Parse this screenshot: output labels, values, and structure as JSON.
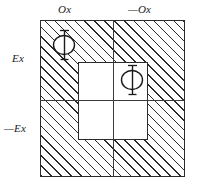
{
  "figure": {
    "background_color": "#ffffff",
    "line_color": "#2b2b2b",
    "hatch": {
      "angle_deg": 45,
      "spacing_px": 7,
      "color": "#2b2b2b"
    },
    "labels": {
      "top_left": "Ox",
      "top_right": "—Ox",
      "left_upper": "Ex",
      "left_lower": "—Ex"
    },
    "symbols": [
      {
        "name": "phi-outer",
        "glyph": "Φ",
        "region": "upper-left-hatched-quadrant"
      },
      {
        "name": "phi-inner",
        "glyph": "Φ",
        "region": "inner-clear-square-upper-right"
      }
    ],
    "regions": {
      "outer_square": "hatched",
      "inner_square": "clear",
      "quadrants": 4
    }
  }
}
